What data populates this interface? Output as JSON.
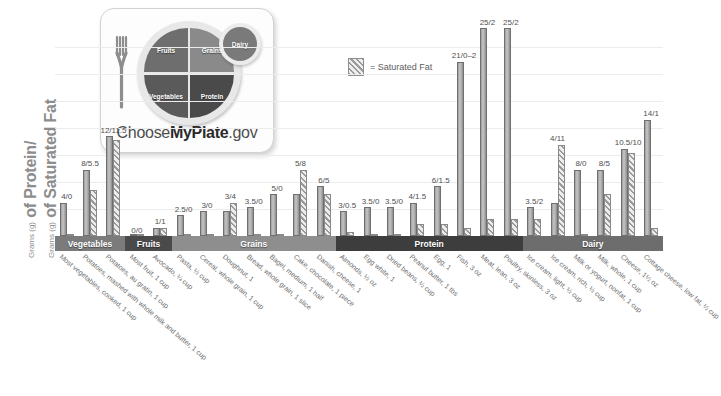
{
  "axis": {
    "y_title_line1_small": "Grams (g)",
    "y_title_line1": " of Protein/",
    "y_title_line2_small": "Grams (g)",
    "y_title_line2": " of Saturated Fat"
  },
  "logo": {
    "name": "ChooseMyPlate.gov",
    "word_choose": "Choose",
    "word_myplate": "MyPlate",
    "word_gov": ".gov",
    "segments": {
      "fruits": "Fruits",
      "grains": "Grains",
      "vegetables": "Vegetables",
      "protein": "Protein",
      "dairy": "Dairy"
    }
  },
  "legend": {
    "label": "= Saturated Fat",
    "swatch_icon": "hatched-bar-icon"
  },
  "chart_data": {
    "type": "bar",
    "title": "",
    "xlabel": "",
    "ylabel": "Grams (g) of Protein/Grams (g) of Saturated Fat",
    "ylim": [
      0,
      26
    ],
    "grid": true,
    "legend_position": "top-center",
    "series": [
      {
        "name": "Protein",
        "style": "solid"
      },
      {
        "name": "Saturated Fat",
        "style": "hatched"
      }
    ],
    "groups": [
      {
        "category": "Vegetables",
        "label": "Most vegetables, cooked, 1 cup",
        "protein": 4,
        "fat": 0,
        "value_label": "4/0"
      },
      {
        "category": "Vegetables",
        "label": "Potatoes, mashed with whole milk and butter, 1 cup",
        "protein": 8,
        "fat": 5.5,
        "value_label": "8/5.5"
      },
      {
        "category": "Vegetables",
        "label": "Potatoes, au gratin, 1 cup",
        "protein": 12,
        "fat": 11.5,
        "value_label": "12/11.5"
      },
      {
        "category": "Fruits",
        "label": "Most fruit, 1 cup",
        "protein": 0,
        "fat": 0,
        "value_label": "0/0"
      },
      {
        "category": "Fruits",
        "label": "Avocado, ¼ cup",
        "protein": 1,
        "fat": 1,
        "value_label": "1/1"
      },
      {
        "category": "Grains",
        "label": "Pasta, ½ cup",
        "protein": 2.5,
        "fat": 0,
        "value_label": "2.5/0"
      },
      {
        "category": "Grains",
        "label": "Cereal, whole grain, 1 cup",
        "protein": 3,
        "fat": 0,
        "value_label": "3/0"
      },
      {
        "category": "Grains",
        "label": "Doughnut, 1",
        "protein": 3,
        "fat": 4,
        "value_label": "3/4"
      },
      {
        "category": "Grains",
        "label": "Bread, whole grain, 1 slice",
        "protein": 3.5,
        "fat": 0,
        "value_label": "3.5/0"
      },
      {
        "category": "Grains",
        "label": "Bagel, medium, 1 half",
        "protein": 5,
        "fat": 0,
        "value_label": "5/0"
      },
      {
        "category": "Grains",
        "label": "Cake, chocolate, 1 piece",
        "protein": 5,
        "fat": 8,
        "value_label": "5/8"
      },
      {
        "category": "Grains",
        "label": "Danish, cheese, 1",
        "protein": 6,
        "fat": 5,
        "value_label": "6/5"
      },
      {
        "category": "Protein",
        "label": "Almonds, ½ oz",
        "protein": 3,
        "fat": 0.5,
        "value_label": "3/0.5"
      },
      {
        "category": "Protein",
        "label": "Egg white, 1",
        "protein": 3.5,
        "fat": 0,
        "value_label": "3.5/0"
      },
      {
        "category": "Protein",
        "label": "Dried beans, ½ cup",
        "protein": 3.5,
        "fat": 0,
        "value_label": "3.5/0"
      },
      {
        "category": "Protein",
        "label": "Peanut butter, 1 tbs",
        "protein": 4,
        "fat": 1.5,
        "value_label": "4/1.5"
      },
      {
        "category": "Protein",
        "label": "Egg, 1",
        "protein": 6,
        "fat": 1.5,
        "value_label": "6/1.5"
      },
      {
        "category": "Protein",
        "label": "Fish, 3 oz",
        "protein": 21,
        "fat": 1,
        "value_label": "21/0–2"
      },
      {
        "category": "Protein",
        "label": "Meat, lean, 3 oz",
        "protein": 25,
        "fat": 2,
        "value_label": "25/2"
      },
      {
        "category": "Protein",
        "label": "Poultry, skinless, 3 oz",
        "protein": 25,
        "fat": 2,
        "value_label": "25/2"
      },
      {
        "category": "Dairy",
        "label": "Ice cream, light, ½ cup",
        "protein": 3.5,
        "fat": 2,
        "value_label": "3.5/2"
      },
      {
        "category": "Dairy",
        "label": "Ice cream, rich, ½ cup",
        "protein": 4,
        "fat": 11,
        "value_label": "4/11"
      },
      {
        "category": "Dairy",
        "label": "Milk or yogurt, nonfat, 1 cup",
        "protein": 8,
        "fat": 0,
        "value_label": "8/0"
      },
      {
        "category": "Dairy",
        "label": "Milk, whole, 1 cup",
        "protein": 8,
        "fat": 5,
        "value_label": "8/5"
      },
      {
        "category": "Dairy",
        "label": "Cheese, 1½ oz",
        "protein": 10.5,
        "fat": 10,
        "value_label": "10.5/10"
      },
      {
        "category": "Dairy",
        "label": "Cottage cheese, low fat, ½ cup",
        "protein": 14,
        "fat": 1,
        "value_label": "14/1"
      }
    ],
    "category_bands": [
      {
        "name": "Vegetables",
        "count": 3,
        "color": "#7b7b7b"
      },
      {
        "name": "Fruits",
        "count": 2,
        "color": "#4a4a4a"
      },
      {
        "name": "Grains",
        "count": 7,
        "color": "#8e8e8e"
      },
      {
        "name": "Protein",
        "count": 8,
        "color": "#3d3d3d"
      },
      {
        "name": "Dairy",
        "count": 6,
        "color": "#6d6d6d"
      }
    ]
  }
}
